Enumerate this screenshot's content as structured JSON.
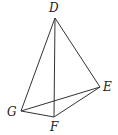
{
  "diagram": {
    "type": "tetrahedron",
    "vertices": [
      {
        "name": "D",
        "x": 55,
        "y": 18,
        "label_x": 49,
        "label_y": 12
      },
      {
        "name": "E",
        "x": 100,
        "y": 87,
        "label_x": 103,
        "label_y": 91
      },
      {
        "name": "F",
        "x": 54,
        "y": 117,
        "label_x": 50,
        "label_y": 131
      },
      {
        "name": "G",
        "x": 21,
        "y": 111,
        "label_x": 7,
        "label_y": 116
      }
    ],
    "edges": [
      [
        "D",
        "G"
      ],
      [
        "D",
        "F"
      ],
      [
        "D",
        "E"
      ],
      [
        "G",
        "F"
      ],
      [
        "F",
        "E"
      ],
      [
        "G",
        "E"
      ]
    ]
  }
}
